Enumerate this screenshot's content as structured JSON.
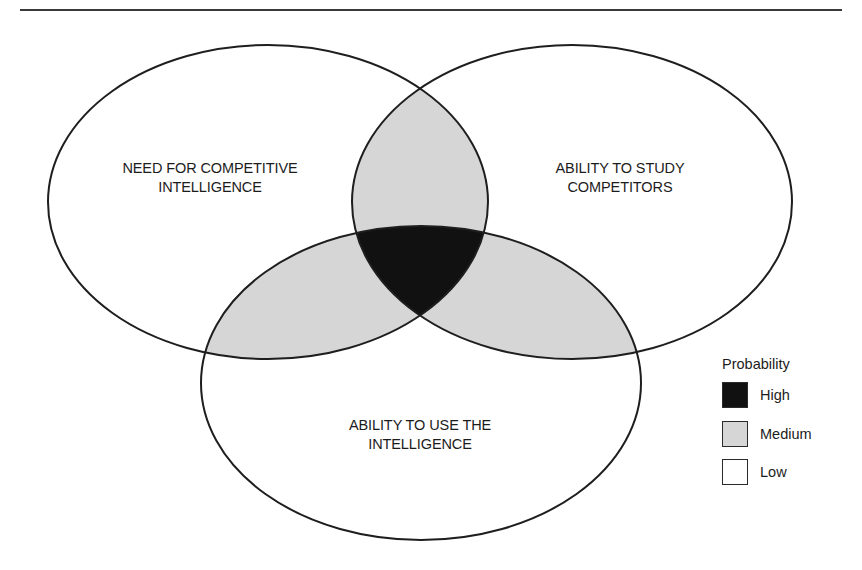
{
  "diagram": {
    "type": "venn",
    "sets": [
      {
        "id": "need",
        "label": "NEED FOR COMPETITIVE INTELLIGENCE",
        "lines": [
          "NEED FOR COMPETITIVE",
          "INTELLIGENCE"
        ]
      },
      {
        "id": "study",
        "label": "ABILITY TO STUDY COMPETITORS",
        "lines": [
          "ABILITY TO STUDY",
          "COMPETITORS"
        ]
      },
      {
        "id": "use",
        "label": "ABILITY TO USE THE INTELLIGENCE",
        "lines": [
          "ABILITY TO USE THE",
          "INTELLIGENCE"
        ]
      }
    ],
    "regions": {
      "single_set": "Low",
      "two_sets": "Medium",
      "all_three": "High"
    }
  },
  "legend": {
    "title": "Probability",
    "items": [
      {
        "label": "High",
        "color": "#111111"
      },
      {
        "label": "Medium",
        "color": "#d6d6d6"
      },
      {
        "label": "Low",
        "color": "#ffffff"
      }
    ]
  },
  "colors": {
    "stroke": "#1e1e1e",
    "high": "#111111",
    "medium": "#d6d6d6",
    "low": "#ffffff"
  }
}
